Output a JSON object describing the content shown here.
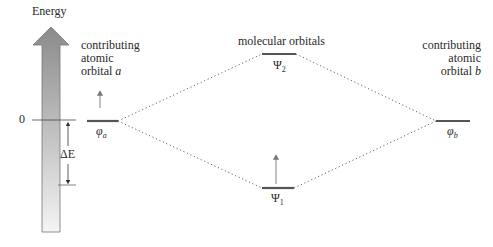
{
  "axis": {
    "label": "Energy",
    "zero_label": "0",
    "delta_label": "ΔE"
  },
  "labels": {
    "atomic_a": [
      "contributing",
      "atomic",
      "orbital"
    ],
    "atomic_a_letter": "a",
    "atomic_b": [
      "contributing",
      "atomic",
      "orbital"
    ],
    "atomic_b_letter": "b",
    "molecular": "molecular orbitals"
  },
  "levels": {
    "phi_a": {
      "symbol": "φ",
      "sub": "a"
    },
    "phi_b": {
      "symbol": "φ",
      "sub": "b"
    },
    "psi_1": {
      "symbol": "Ψ",
      "sub": "1"
    },
    "psi_2": {
      "symbol": "Ψ",
      "sub": "2"
    }
  },
  "colors": {
    "arrow_top": "#8a8a8a",
    "arrow_bottom": "#f2f2f2",
    "level_line": "#555555",
    "dotted": "#666666",
    "text": "#2a2a2a"
  }
}
